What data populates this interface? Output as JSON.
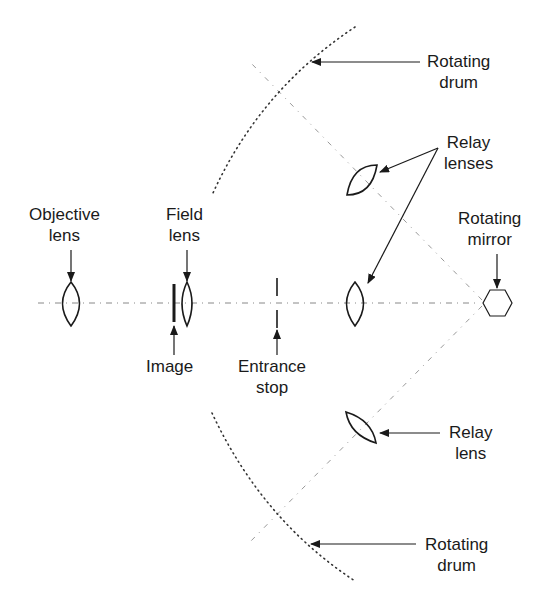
{
  "diagram": {
    "colors": {
      "stroke": "#1a1a1a",
      "axis": "#888888",
      "drum": "#333333"
    },
    "labels": {
      "rotating_drum_top": {
        "line1": "Rotating",
        "line2": "drum"
      },
      "relay_lenses": {
        "line1": "Relay",
        "line2": "lenses"
      },
      "objective_lens": {
        "line1": "Objective",
        "line2": "lens"
      },
      "field_lens": {
        "line1": "Field",
        "line2": "lens"
      },
      "rotating_mirror": {
        "line1": "Rotating",
        "line2": "mirror"
      },
      "image": {
        "line1": "Image"
      },
      "entrance_stop": {
        "line1": "Entrance",
        "line2": "stop"
      },
      "relay_lens": {
        "line1": "Relay",
        "line2": "lens"
      },
      "rotating_drum_bottom": {
        "line1": "Rotating",
        "line2": "drum"
      }
    },
    "components": [
      "Objective lens",
      "Image",
      "Field lens",
      "Entrance stop",
      "Relay lenses",
      "Rotating mirror",
      "Relay lens",
      "Rotating drum"
    ]
  }
}
